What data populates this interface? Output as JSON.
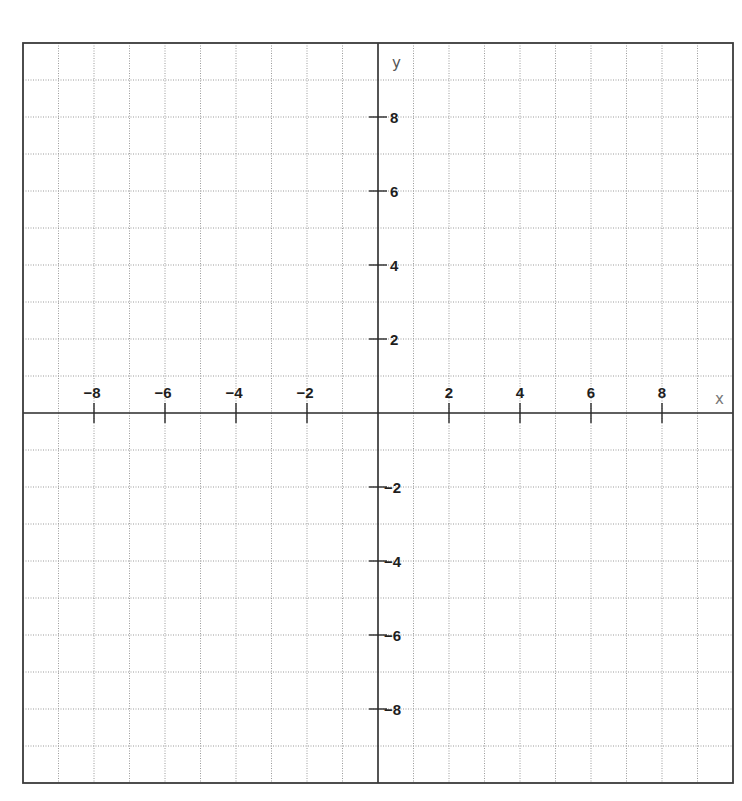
{
  "chart_data": {
    "type": "scatter",
    "title": "",
    "xlabel": "x",
    "ylabel": "y",
    "xlim": [
      -10,
      10
    ],
    "ylim": [
      -10,
      10
    ],
    "grid": true,
    "grid_step": 1,
    "x_ticks": [
      -8,
      -6,
      -4,
      -2,
      2,
      4,
      6,
      8
    ],
    "y_ticks": [
      8,
      6,
      4,
      2,
      -2,
      -4,
      -6,
      -8
    ],
    "x_tick_labels": [
      "−8",
      "−6",
      "−4",
      "−2",
      "2",
      "4",
      "6",
      "8"
    ],
    "y_tick_labels": [
      "8",
      "6",
      "4",
      "2",
      "−2",
      "−4",
      "−6",
      "−8"
    ],
    "series": [],
    "legend": null
  },
  "layout": {
    "origin_px": [
      378,
      413
    ],
    "unit_x_px": 35.5,
    "unit_y_px": 37,
    "colors": {
      "grid": "#9a9a9a",
      "axis": "#2a2a2a",
      "border": "#3a3a3a",
      "label": "#1e1e1e"
    }
  },
  "labels": {
    "x_axis_name": "x",
    "y_axis_name": "y"
  }
}
